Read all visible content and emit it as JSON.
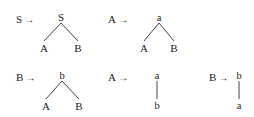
{
  "figure": {
    "kind": "grammar-production-rules",
    "arrow_glyph": "→",
    "ink_color": "#1b1b1b",
    "background_color": "#ffffff",
    "rules": [
      {
        "id": "rule-1",
        "lhs": "S",
        "arrow": "→",
        "tree": {
          "shape": "binary",
          "root": "S",
          "children": [
            "A",
            "B"
          ]
        }
      },
      {
        "id": "rule-2",
        "lhs": "A",
        "arrow": "→",
        "tree": {
          "shape": "binary",
          "root": "a",
          "children": [
            "A",
            "B"
          ]
        }
      },
      {
        "id": "rule-3",
        "lhs": "B",
        "arrow": "→",
        "tree": {
          "shape": "binary",
          "root": "b",
          "children": [
            "A",
            "B"
          ]
        }
      },
      {
        "id": "rule-4",
        "lhs": "A",
        "arrow": "→",
        "tree": {
          "shape": "unary",
          "root": "a",
          "children": [
            "b"
          ]
        }
      },
      {
        "id": "rule-5",
        "lhs": "B",
        "arrow": "→",
        "tree": {
          "shape": "unary",
          "root": "b",
          "children": [
            "a"
          ]
        }
      }
    ]
  }
}
